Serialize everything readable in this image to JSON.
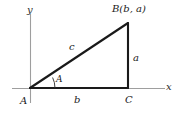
{
  "figure": {
    "type": "geometry-diagram",
    "background_color": "#ffffff",
    "axes": {
      "x_label": "x",
      "y_label": "y",
      "axis_color": "#9a9a9a",
      "origin_label": "A"
    },
    "triangle": {
      "stroke_color": "#1a1a1a",
      "vertices": [
        {
          "name": "A",
          "label": "A",
          "role": "origin-vertex",
          "x": 30,
          "y": 88
        },
        {
          "name": "C",
          "label": "C",
          "role": "right-angle-vertex",
          "x": 128,
          "y": 88
        },
        {
          "name": "B",
          "label": "B(b, a)",
          "role": "apex-vertex",
          "x": 128,
          "y": 23
        }
      ],
      "sides": [
        {
          "name": "hypotenuse",
          "label": "c",
          "from": "A",
          "to": "B"
        },
        {
          "name": "vertical-leg",
          "label": "a",
          "from": "C",
          "to": "B"
        },
        {
          "name": "horizontal-leg",
          "label": "b",
          "from": "A",
          "to": "C"
        }
      ],
      "angle": {
        "label": "A",
        "at_vertex": "A",
        "marker": "arc"
      }
    }
  }
}
